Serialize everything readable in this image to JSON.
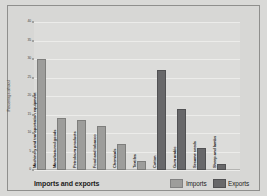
{
  "chart_data": {
    "type": "bar",
    "title": "Imports and exports",
    "xlabel": "",
    "ylabel": "Percentage of total",
    "ylim": [
      0,
      40
    ],
    "ytick_values": [
      0,
      5,
      10,
      15,
      20,
      25,
      30,
      35,
      40
    ],
    "ytick_labels": [
      "0",
      "5",
      "10",
      "15",
      "20",
      "25",
      "30",
      "35",
      "40"
    ],
    "grid": true,
    "legend_position": "bottom-right",
    "legend": [
      "Imports",
      "Exports"
    ],
    "colors": {
      "imports": "#9d9d9b",
      "exports": "#68686a",
      "plot_background": "#dcdcda",
      "figure_background": "#d7d7d5",
      "gridline": "#ececea",
      "text": "#1d1d1b"
    },
    "categories": [
      "Machinery and transportation equipment",
      "Manufactured goods",
      "Petroleum products",
      "Food and tobacco",
      "Chemicals",
      "Textiles",
      "Cotton",
      "Gum arabic",
      "Sesame seeds",
      "Sheep and lambs"
    ],
    "bars": [
      {
        "category": "Machinery and transportation equipment",
        "series": "Imports",
        "value": 30
      },
      {
        "category": "Manufactured goods",
        "series": "Imports",
        "value": 14
      },
      {
        "category": "Petroleum products",
        "series": "Imports",
        "value": 13.5
      },
      {
        "category": "Food and tobacco",
        "series": "Imports",
        "value": 12
      },
      {
        "category": "Chemicals",
        "series": "Imports",
        "value": 7
      },
      {
        "category": "Textiles",
        "series": "Imports",
        "value": 2.5
      },
      {
        "category": "Cotton",
        "series": "Exports",
        "value": 27
      },
      {
        "category": "Gum arabic",
        "series": "Exports",
        "value": 16.5
      },
      {
        "category": "Sesame seeds",
        "series": "Exports",
        "value": 6
      },
      {
        "category": "Sheep and lambs",
        "series": "Exports",
        "value": 1.5
      }
    ],
    "series": [
      {
        "name": "Imports",
        "values": [
          30,
          14,
          13.5,
          12,
          7,
          2.5,
          null,
          null,
          null,
          null
        ]
      },
      {
        "name": "Exports",
        "values": [
          null,
          null,
          null,
          null,
          null,
          null,
          27,
          16.5,
          6,
          1.5
        ]
      }
    ]
  }
}
